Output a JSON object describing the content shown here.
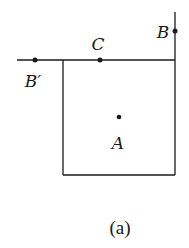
{
  "figure": {
    "caption": "(a)",
    "stroke_color": "#1a1a1a",
    "points": [
      {
        "id": "A",
        "label": "A",
        "x": 119,
        "y": 117,
        "label_x": 118,
        "label_y": 149
      },
      {
        "id": "B",
        "label": "B",
        "x": 175,
        "y": 31,
        "label_x": 163,
        "label_y": 38
      },
      {
        "id": "C",
        "label": "C",
        "x": 100,
        "y": 60,
        "label_x": 98,
        "label_y": 50
      },
      {
        "id": "Bprime",
        "label": "B′",
        "x": 35,
        "y": 60,
        "label_x": 33,
        "label_y": 87
      }
    ],
    "lines": {
      "horizontal": {
        "x1": 17,
        "y1": 60,
        "x2": 175,
        "y2": 60
      },
      "vertical_right": {
        "x1": 175,
        "y1": 12,
        "x2": 175,
        "y2": 175
      },
      "square": {
        "x": 63,
        "y": 60,
        "width": 112,
        "height": 115
      }
    }
  }
}
